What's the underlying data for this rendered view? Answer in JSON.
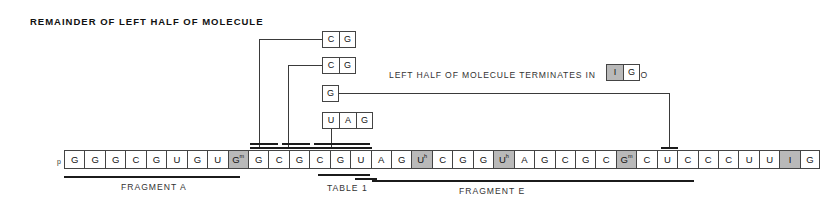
{
  "figure": {
    "title": "REMAINDER OF LEFT HALF OF MOLECULE",
    "terminates_text": "LEFT HALF OF MOLECULE TERMINATES IN",
    "so_text": "SO",
    "five_prime_label": "p"
  },
  "terminal_boxes": [
    {
      "base": "I",
      "shaded": true
    },
    {
      "base": "G",
      "shaded": false
    }
  ],
  "groups": [
    {
      "name": "group-cg-1",
      "bases": [
        {
          "base": "C"
        },
        {
          "base": "G"
        }
      ]
    },
    {
      "name": "group-cg-2",
      "bases": [
        {
          "base": "C"
        },
        {
          "base": "G"
        }
      ]
    },
    {
      "name": "group-g",
      "bases": [
        {
          "base": "G"
        }
      ]
    },
    {
      "name": "group-uag",
      "bases": [
        {
          "base": "U"
        },
        {
          "base": "A"
        },
        {
          "base": "G"
        }
      ]
    }
  ],
  "sequence": [
    {
      "base": "G",
      "sup": "",
      "shaded": false
    },
    {
      "base": "G",
      "sup": "",
      "shaded": false
    },
    {
      "base": "G",
      "sup": "",
      "shaded": false
    },
    {
      "base": "C",
      "sup": "",
      "shaded": false
    },
    {
      "base": "G",
      "sup": "",
      "shaded": false
    },
    {
      "base": "U",
      "sup": "",
      "shaded": false
    },
    {
      "base": "G",
      "sup": "",
      "shaded": false
    },
    {
      "base": "U",
      "sup": "",
      "shaded": false
    },
    {
      "base": "G",
      "sup": "m",
      "shaded": true
    },
    {
      "base": "G",
      "sup": "",
      "shaded": false
    },
    {
      "base": "C",
      "sup": "",
      "shaded": false
    },
    {
      "base": "G",
      "sup": "",
      "shaded": false
    },
    {
      "base": "C",
      "sup": "",
      "shaded": false
    },
    {
      "base": "G",
      "sup": "",
      "shaded": false
    },
    {
      "base": "U",
      "sup": "",
      "shaded": false
    },
    {
      "base": "A",
      "sup": "",
      "shaded": false
    },
    {
      "base": "G",
      "sup": "",
      "shaded": false
    },
    {
      "base": "U",
      "sup": "h",
      "shaded": true
    },
    {
      "base": "C",
      "sup": "",
      "shaded": false
    },
    {
      "base": "G",
      "sup": "",
      "shaded": false
    },
    {
      "base": "G",
      "sup": "",
      "shaded": false
    },
    {
      "base": "U",
      "sup": "h",
      "shaded": true
    },
    {
      "base": "A",
      "sup": "",
      "shaded": false
    },
    {
      "base": "G",
      "sup": "",
      "shaded": false
    },
    {
      "base": "C",
      "sup": "",
      "shaded": false
    },
    {
      "base": "G",
      "sup": "",
      "shaded": false
    },
    {
      "base": "C",
      "sup": "",
      "shaded": false
    },
    {
      "base": "G",
      "sup": "m",
      "shaded": true
    },
    {
      "base": "C",
      "sup": "",
      "shaded": false
    },
    {
      "base": "U",
      "sup": "",
      "shaded": false
    },
    {
      "base": "C",
      "sup": "",
      "shaded": false
    },
    {
      "base": "C",
      "sup": "",
      "shaded": false
    },
    {
      "base": "C",
      "sup": "",
      "shaded": false
    },
    {
      "base": "U",
      "sup": "",
      "shaded": false
    },
    {
      "base": "U",
      "sup": "",
      "shaded": false
    },
    {
      "base": "I",
      "sup": "",
      "shaded": true
    },
    {
      "base": "G",
      "sup": "",
      "shaded": false
    }
  ],
  "annotations": {
    "fragment_a": "FRAGMENT A",
    "table_1": "TABLE 1",
    "fragment_e": "FRAGMENT E"
  }
}
